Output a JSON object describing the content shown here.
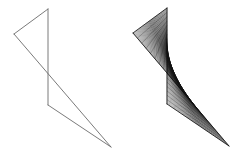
{
  "figure": {
    "background_color": "#ffffff",
    "width": 246,
    "height": 161,
    "panels": [
      {
        "id": "wireframe-panel",
        "name": "skew-lines-wireframe",
        "caption": "",
        "style": "outline",
        "stroke_color": "#6b6b6b",
        "stroke_width": 0.9,
        "vertices": {
          "A": [
            48,
            9
          ],
          "B": [
            14,
            34
          ],
          "C": [
            48,
            105
          ],
          "D": [
            111,
            147
          ]
        },
        "edges": [
          {
            "name": "edge-A-B",
            "from": "A",
            "to": "B"
          },
          {
            "name": "edge-B-D",
            "from": "B",
            "to": "D"
          },
          {
            "name": "edge-A-C",
            "from": "A",
            "to": "C"
          },
          {
            "name": "edge-C-D",
            "from": "C",
            "to": "D"
          }
        ],
        "directrix_1": {
          "name": "segment-A-B",
          "from": [
            48,
            9
          ],
          "to": [
            14,
            34
          ]
        },
        "directrix_2": {
          "name": "segment-C-D",
          "from": [
            48,
            105
          ],
          "to": [
            111,
            147
          ]
        }
      },
      {
        "id": "mesh-panel",
        "name": "ruled-surface-mesh",
        "caption": "",
        "style": "wireframe-mesh",
        "stroke_color": "#0a0a0a",
        "stroke_width": 0.55,
        "ruling_count": 48,
        "cross_section_count": 22,
        "vertices": {
          "A": [
            167,
            8
          ],
          "B": [
            133,
            33
          ],
          "C": [
            167,
            104
          ],
          "D": [
            229,
            146
          ]
        },
        "edges": [
          {
            "name": "edge-A-B",
            "from": "A",
            "to": "B"
          },
          {
            "name": "edge-B-D",
            "from": "B",
            "to": "D"
          },
          {
            "name": "edge-A-C",
            "from": "A",
            "to": "C"
          },
          {
            "name": "edge-C-D",
            "from": "C",
            "to": "D"
          }
        ],
        "directrix_1": {
          "name": "segment-A-B",
          "from": [
            167,
            8
          ],
          "to": [
            133,
            33
          ]
        },
        "directrix_2": {
          "name": "segment-C-D",
          "from": [
            167,
            104
          ],
          "to": [
            229,
            146
          ]
        }
      }
    ]
  }
}
